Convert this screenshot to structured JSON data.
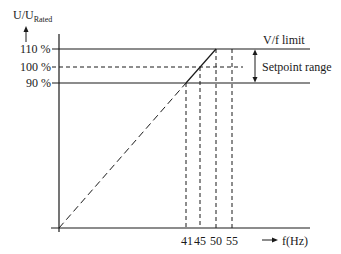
{
  "diagram": {
    "y_axis_label": "U/U",
    "y_axis_label_sub": "Rated",
    "x_axis_label": "f(Hz)",
    "y_ticks": [
      {
        "label": "110 %",
        "value": 110
      },
      {
        "label": "100 %",
        "value": 100
      },
      {
        "label": "90 %",
        "value": 90
      }
    ],
    "x_ticks": [
      {
        "label": "41",
        "value": 41
      },
      {
        "label": "45",
        "value": 45
      },
      {
        "label": "50",
        "value": 50
      },
      {
        "label": "55",
        "value": 55
      }
    ],
    "annotations": {
      "vf_limit": "V/f limit",
      "setpoint_range": "Setpoint range"
    },
    "colors": {
      "line": "#1a1a1a",
      "background": "#ffffff"
    }
  }
}
